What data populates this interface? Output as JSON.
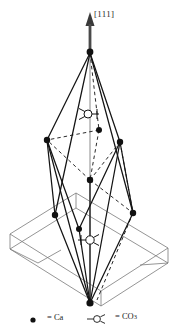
{
  "figure": {
    "name": "calcite-rhombohedral-unit-cell",
    "direction_label": "[111]",
    "stroke_color": "#1a1a1a",
    "faint_stroke_color": "#6e6e6e",
    "background": "#ffffff"
  },
  "legend": {
    "items": [
      {
        "symbol": "ca-dot",
        "equals": "=",
        "label": "Ca"
      },
      {
        "symbol": "co3-glyph",
        "equals": "=",
        "label": "CO",
        "subscript": "3"
      }
    ],
    "ca_text": "= Ca",
    "co3_text": "= CO",
    "co3_sub": "3"
  },
  "atoms": {
    "ca_sites": [
      {
        "id": "apex-top",
        "x": 90,
        "y": 52
      },
      {
        "id": "upper-left",
        "x": 47,
        "y": 140
      },
      {
        "id": "upper-right",
        "x": 120,
        "y": 142
      },
      {
        "id": "interior",
        "x": 99,
        "y": 130
      },
      {
        "id": "mid-center",
        "x": 90,
        "y": 180
      },
      {
        "id": "lower-left",
        "x": 55,
        "y": 215
      },
      {
        "id": "lower-right",
        "x": 133,
        "y": 213
      },
      {
        "id": "inner-low",
        "x": 79,
        "y": 229
      },
      {
        "id": "apex-bottom",
        "x": 90,
        "y": 303
      }
    ],
    "co3_sites": [
      {
        "id": "co3-upper",
        "x": 88,
        "y": 114,
        "flip": false
      },
      {
        "id": "co3-lower",
        "x": 90,
        "y": 240,
        "flip": true
      }
    ]
  },
  "cell_geometry": {
    "slab_top_face": [
      [
        10,
        234
      ],
      [
        76,
        193
      ],
      [
        168,
        248
      ],
      [
        101,
        291
      ]
    ],
    "slab_bottom_face": [
      [
        10,
        249
      ],
      [
        76,
        208
      ],
      [
        168,
        263
      ],
      [
        101,
        306
      ]
    ],
    "axis_line": {
      "x1": 90,
      "y1": 28,
      "x2": 90,
      "y2": 305
    },
    "arrow_tip": {
      "x": 90,
      "y": 14
    }
  }
}
